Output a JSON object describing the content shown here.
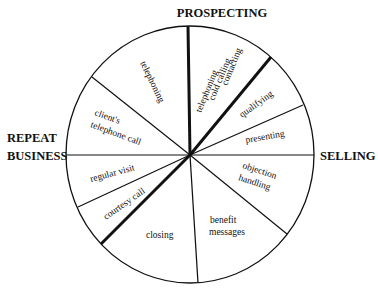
{
  "diagram": {
    "type": "sales-cycle-wheel",
    "phases": {
      "top": "PROSPECTING",
      "right": "SELLING",
      "left_line1": "REPEAT",
      "left_line2": "BUSINESS"
    },
    "segments": {
      "telephoning": "telephoning",
      "prospect_line1": "telephoning",
      "prospect_line2": "cold calling",
      "prospect_line3": "contacting",
      "qualifying": "qualifying",
      "presenting": "presenting",
      "objection_line1": "objection",
      "objection_line2": "handling",
      "benefit_line1": "benefit",
      "benefit_line2": "messages",
      "closing": "closing",
      "courtesy_call": "courtesy call",
      "regular_visit": "regular visit",
      "client_line1": "client's",
      "client_line2": "telephone call"
    },
    "colors": {
      "line": "#111111",
      "background": "#ffffff"
    }
  }
}
